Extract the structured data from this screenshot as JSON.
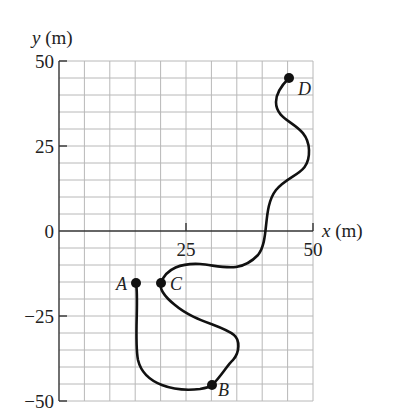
{
  "figure": {
    "type": "position-path-diagram",
    "axes": {
      "x_label": "x (m)",
      "y_label": "y (m)",
      "x_ticks": [
        "25",
        "50"
      ],
      "y_ticks": [
        "50",
        "25",
        "0",
        "−25",
        "−50"
      ],
      "x_range": [
        0,
        50
      ],
      "y_range": [
        -50,
        50
      ],
      "grid_step_m": 5
    },
    "points": [
      {
        "label": "A",
        "x": 15,
        "y": -15
      },
      {
        "label": "B",
        "x": 30,
        "y": -45
      },
      {
        "label": "C",
        "x": 20,
        "y": -15
      },
      {
        "label": "D",
        "x": 45,
        "y": 45
      }
    ],
    "path_order": [
      "A",
      "B",
      "C",
      "D"
    ],
    "colors": {
      "grid": "#b8b8b8",
      "axis": "#333333",
      "path": "#111111",
      "background": "#ffffff"
    }
  }
}
